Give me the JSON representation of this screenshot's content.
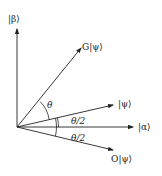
{
  "diagram": {
    "type": "vector rotation diagram",
    "origin": [
      17,
      127
    ],
    "axes": {
      "beta": {
        "label": "|β⟩",
        "end": [
          17,
          28
        ]
      },
      "alpha": {
        "label": "|α⟩",
        "end": [
          134,
          127
        ]
      }
    },
    "vectors": [
      {
        "id": "psi",
        "label": "|ψ⟩",
        "end": [
          114,
          105
        ]
      },
      {
        "id": "G_psi",
        "label": "G|ψ⟩",
        "end": [
          82,
          47
        ]
      },
      {
        "id": "O_psi",
        "label": "O|ψ⟩",
        "end": [
          114,
          150
        ]
      }
    ],
    "angles": [
      {
        "label": "θ",
        "between": [
          "psi",
          "G_psi"
        ]
      },
      {
        "label": "θ/2",
        "between": [
          "alpha",
          "psi"
        ]
      },
      {
        "label": "θ/2",
        "between": [
          "O_psi",
          "alpha"
        ]
      }
    ],
    "line_color": "#222222"
  }
}
